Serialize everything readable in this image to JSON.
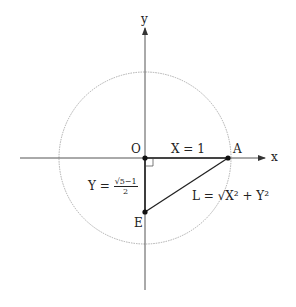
{
  "axes": {
    "x_label": "x",
    "y_label": "y"
  },
  "points": {
    "origin": "O",
    "a": "A",
    "e": "E"
  },
  "labels": {
    "x_eq": "X = 1",
    "y_lhs": "Y =",
    "y_num": "√5−1",
    "y_den": "2",
    "l_eq": "L = √X² + Y²"
  },
  "colors": {
    "line": "#222222",
    "circle": "#9a9a9a",
    "axis": "#555555"
  }
}
